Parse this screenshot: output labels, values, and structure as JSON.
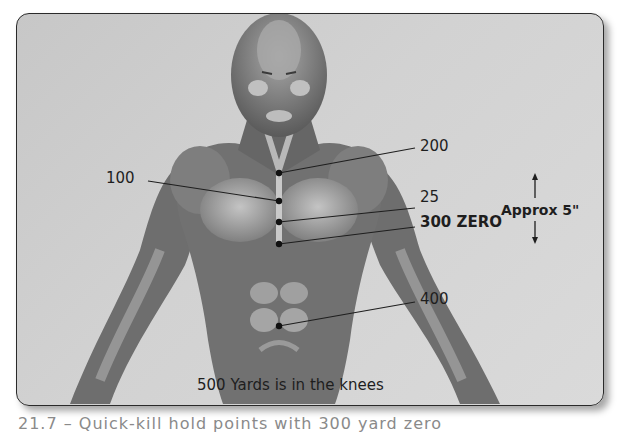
{
  "figure": {
    "labels": {
      "l200": "200",
      "l100": "100",
      "l25": "25",
      "l300": "300 ZERO",
      "l400": "400",
      "approx": "Approx 5\"",
      "knees": "500 Yards is in the knees"
    },
    "hold_points": [
      {
        "label": "200",
        "x": 279,
        "y": 173
      },
      {
        "label": "100",
        "x": 279,
        "y": 201
      },
      {
        "label": "25",
        "x": 279,
        "y": 222
      },
      {
        "label": "300 ZERO",
        "x": 279,
        "y": 244
      },
      {
        "label": "400",
        "x": 279,
        "y": 326
      }
    ],
    "colors": {
      "background": "#d0d0d0",
      "figure_dark": "#5e5e5e",
      "figure_mid": "#8a8a8a",
      "figure_light": "#b5b5b5",
      "dot": "#111111",
      "text": "#1e1e1e"
    }
  },
  "caption": "21.7 – Quick-kill hold points with 300 yard zero"
}
